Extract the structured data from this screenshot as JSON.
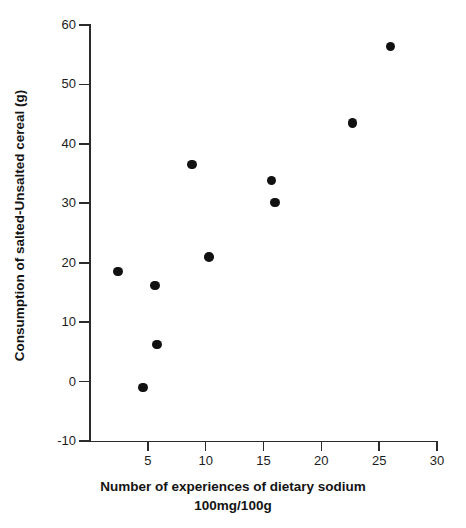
{
  "chart_data": {
    "type": "scatter",
    "title": "",
    "xlabel": "Number of experiences of dietary sodium 100mg/100g",
    "xlabel_line1": "Number of experiences of dietary sodium",
    "xlabel_line2": "100mg/100g",
    "ylabel": "Consumption of salted-Unsalted cereal (g)",
    "xlim": [
      0,
      30
    ],
    "ylim": [
      -10,
      60
    ],
    "xticks": [
      5,
      10,
      15,
      20,
      25,
      30
    ],
    "xtick_labels": [
      "5",
      "10",
      "15",
      "20",
      "25",
      "30"
    ],
    "yticks": [
      -10,
      0,
      10,
      20,
      30,
      40,
      50,
      60
    ],
    "ytick_labels": [
      "-10",
      "0",
      "10",
      "20",
      "30",
      "40",
      "50",
      "60"
    ],
    "grid": false,
    "legend": false,
    "marker": "filled-circle",
    "marker_color": "#111111",
    "axis_color": "#2b2b2b",
    "background": "#ffffff",
    "points": [
      {
        "x": 2.4,
        "y": 18.5
      },
      {
        "x": 4.6,
        "y": -1.0
      },
      {
        "x": 5.6,
        "y": 16.2
      },
      {
        "x": 5.8,
        "y": 6.2
      },
      {
        "x": 8.8,
        "y": 36.5
      },
      {
        "x": 10.3,
        "y": 21.0
      },
      {
        "x": 15.7,
        "y": 33.8
      },
      {
        "x": 16.0,
        "y": 30.1
      },
      {
        "x": 22.7,
        "y": 43.5
      },
      {
        "x": 26.0,
        "y": 56.4
      }
    ]
  }
}
